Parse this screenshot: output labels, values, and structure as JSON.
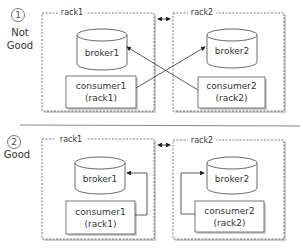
{
  "scenarios": [
    {
      "number": "①",
      "verdict_line1": "Not",
      "verdict_line2": "Good",
      "racks": [
        {
          "name": "rack1",
          "broker": "broker1",
          "consumer": "consumer1",
          "consumer_rack": "(rack1)"
        },
        {
          "name": "rack2",
          "broker": "broker2",
          "consumer": "consumer2",
          "consumer_rack": "(rack2)"
        }
      ],
      "connection": "cross-rack"
    },
    {
      "number": "②",
      "verdict_line1": "Good",
      "racks": [
        {
          "name": "rack1",
          "broker": "broker1",
          "consumer": "consumer1",
          "consumer_rack": "(rack1)"
        },
        {
          "name": "rack2",
          "broker": "broker2",
          "consumer": "consumer2",
          "consumer_rack": "(rack2)"
        }
      ],
      "connection": "same-rack"
    }
  ],
  "colors": {
    "line": "#333333",
    "box_border": "#555555",
    "shadow": "#9a9a9a",
    "divider": "#888888"
  }
}
